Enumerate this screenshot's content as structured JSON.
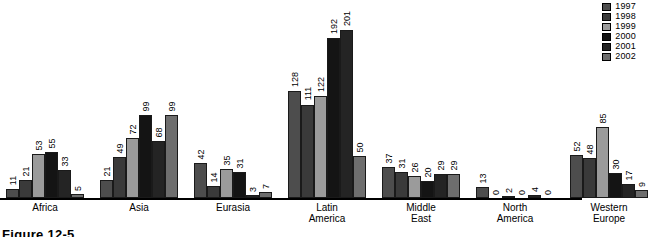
{
  "legend": {
    "position": "top-right",
    "entries": [
      {
        "label": "1997",
        "color": "#4d4d4d"
      },
      {
        "label": "1998",
        "color": "#3a3a3a"
      },
      {
        "label": "1999",
        "color": "#9b9b9b"
      },
      {
        "label": "2000",
        "color": "#141414"
      },
      {
        "label": "2001",
        "color": "#242424"
      },
      {
        "label": "2002",
        "color": "#6e6e6e"
      }
    ]
  },
  "caption": {
    "text": "Figure 12-5"
  },
  "chart_data": {
    "type": "bar",
    "title": "",
    "subtitle": "",
    "xlabel": "",
    "ylabel": "",
    "ylim": [
      0,
      201
    ],
    "grid": false,
    "legend_position": "top-right",
    "data_labels": true,
    "categories": [
      "Africa",
      "Asia",
      "Eurasia",
      "Latin\nAmerica",
      "Middle\nEast",
      "North\nAmerica",
      "Western\nEurope"
    ],
    "series": [
      {
        "name": "1997",
        "color": "#4d4d4d",
        "values": [
          11,
          21,
          42,
          128,
          37,
          13,
          52
        ]
      },
      {
        "name": "1998",
        "color": "#3a3a3a",
        "values": [
          21,
          49,
          14,
          111,
          31,
          0,
          48
        ]
      },
      {
        "name": "1999",
        "color": "#9b9b9b",
        "values": [
          53,
          72,
          35,
          122,
          26,
          2,
          85
        ]
      },
      {
        "name": "2000",
        "color": "#141414",
        "values": [
          55,
          99,
          31,
          192,
          20,
          0,
          30
        ]
      },
      {
        "name": "2001",
        "color": "#242424",
        "values": [
          33,
          68,
          3,
          201,
          29,
          4,
          17
        ]
      },
      {
        "name": "2002",
        "color": "#6e6e6e",
        "values": [
          5,
          99,
          7,
          50,
          29,
          0,
          9
        ]
      }
    ]
  }
}
